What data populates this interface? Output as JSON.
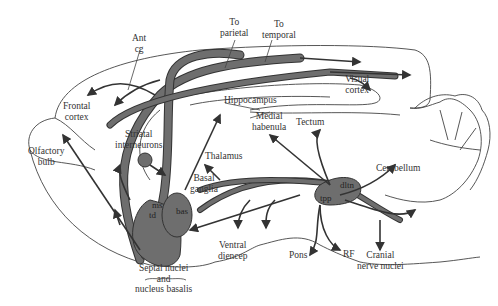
{
  "diagram": {
    "type": "sagittal-brain-pathway-diagram",
    "colors": {
      "pathway_fill": "#6e6e6e",
      "pathway_edge": "#333333",
      "outline": "#444444",
      "text": "#333333"
    },
    "labels": {
      "ant_cg": [
        "Ant",
        "cg"
      ],
      "to_parietal": [
        "To",
        "parietal"
      ],
      "to_temporal": [
        "To",
        "temporal"
      ],
      "visual_cortex": [
        "Visual",
        "cortex"
      ],
      "frontal_cortex": [
        "Frontal",
        "cortex"
      ],
      "hippocampus": "Hippocampus",
      "medial_habenula": [
        "Medial",
        "habenula"
      ],
      "tectum": "Tectum",
      "striatal_interneurons": [
        "Striatal",
        "interneurons"
      ],
      "thalamus": "Thalamus",
      "olfactory_bulb": [
        "Olfactory",
        "bulb"
      ],
      "basal_ganglia": [
        "Basal",
        "ganglia"
      ],
      "cerebellum": "Cerebellum",
      "ms": "ms",
      "td": "td",
      "bas": "bas",
      "dltn": "dltn",
      "tpp": "tpp",
      "ventral_diencep": [
        "Ventral",
        "diencep"
      ],
      "pons": "Pons",
      "rf": "RF",
      "cranial_nerve_nuclei": [
        "Cranial",
        "nerve nuclei"
      ],
      "septal_nuclei": [
        "Septal nuclei",
        "and",
        "nucleus basalis"
      ]
    }
  }
}
